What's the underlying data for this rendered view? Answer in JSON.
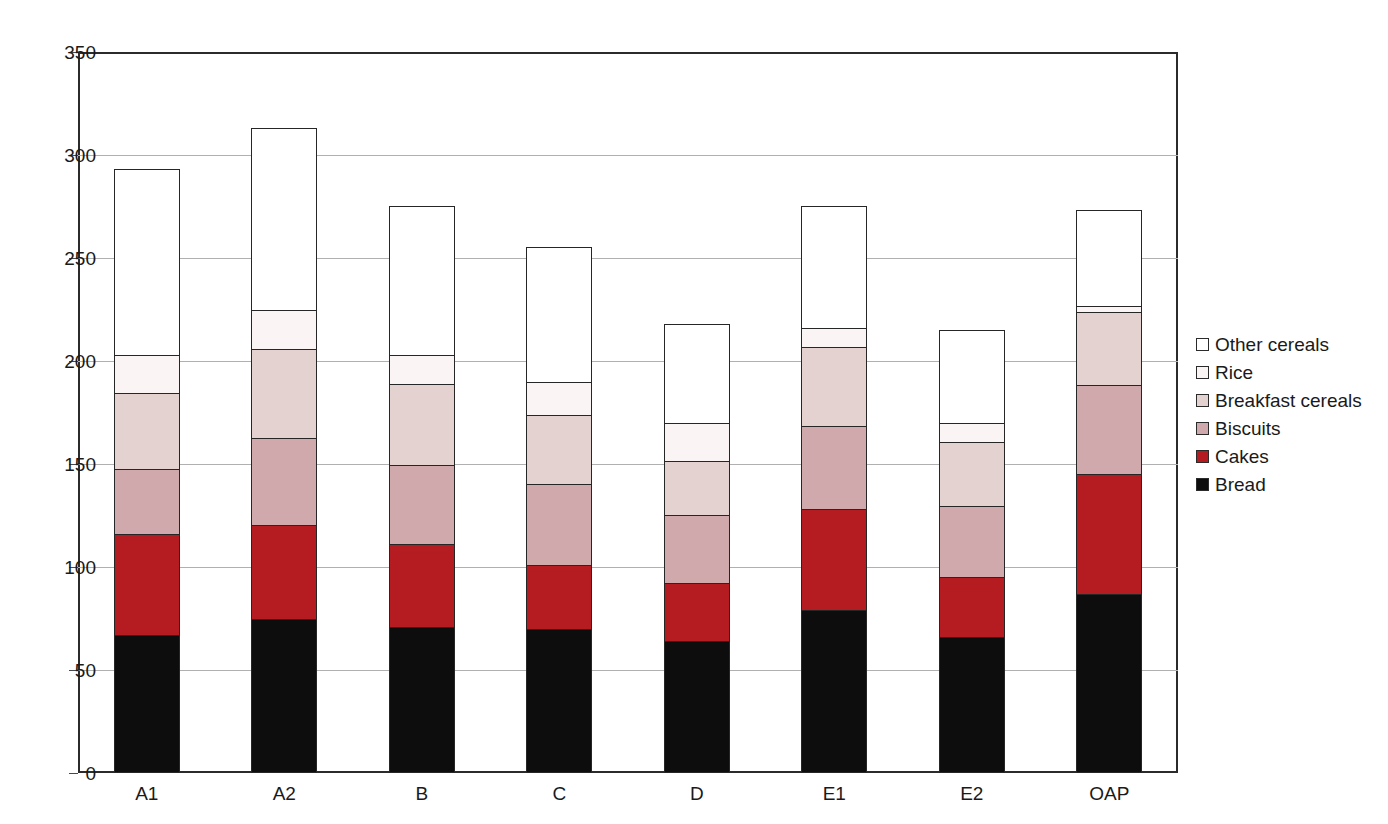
{
  "chart_data": {
    "type": "bar",
    "stacked": true,
    "title": "",
    "xlabel": "",
    "ylabel": "",
    "ylim": [
      0,
      350
    ],
    "ytick_step": 50,
    "yticks": [
      0,
      50,
      100,
      150,
      200,
      250,
      300,
      350
    ],
    "grid": true,
    "legend_position": "right",
    "categories": [
      "A1",
      "A2",
      "B",
      "C",
      "D",
      "E1",
      "E2",
      "OAP"
    ],
    "series": [
      {
        "name": "Bread",
        "color": "#0d0d0d",
        "values": [
          67,
          75,
          71,
          70,
          64,
          79,
          66,
          87
        ]
      },
      {
        "name": "Cakes",
        "color": "#b41c22",
        "values": [
          50,
          46,
          41,
          32,
          29,
          50,
          30,
          59
        ]
      },
      {
        "name": "Biscuits",
        "color": "#cfa9ab",
        "values": [
          32,
          43,
          39,
          40,
          34,
          41,
          35,
          44
        ]
      },
      {
        "name": "Breakfast cereals",
        "color": "#e3d2d0",
        "values": [
          38,
          44,
          40,
          34,
          27,
          39,
          32,
          36
        ]
      },
      {
        "name": "Rice",
        "color": "#faf5f4",
        "values": [
          19,
          20,
          15,
          17,
          19,
          10,
          10,
          4
        ]
      },
      {
        "name": "Other cereals",
        "color": "#ffffff",
        "values": [
          91,
          89,
          73,
          66,
          49,
          60,
          46,
          47
        ]
      }
    ],
    "totals": [
      297,
      317,
      279,
      259,
      222,
      279,
      219,
      277
    ]
  },
  "legend": {
    "items": [
      {
        "label": "Other cereals",
        "color": "#ffffff"
      },
      {
        "label": "Rice",
        "color": "#faf5f4"
      },
      {
        "label": "Breakfast cereals",
        "color": "#e3d2d0"
      },
      {
        "label": "Biscuits",
        "color": "#cfa9ab"
      },
      {
        "label": "Cakes",
        "color": "#b41c22"
      },
      {
        "label": "Bread",
        "color": "#0d0d0d"
      }
    ]
  },
  "axis": {
    "y_tick_labels": [
      "350",
      "300",
      "250",
      "200",
      "150",
      "100",
      "50",
      "0"
    ],
    "x_tick_labels": [
      "A1",
      "A2",
      "B",
      "C",
      "D",
      "E1",
      "E2",
      "OAP"
    ]
  }
}
